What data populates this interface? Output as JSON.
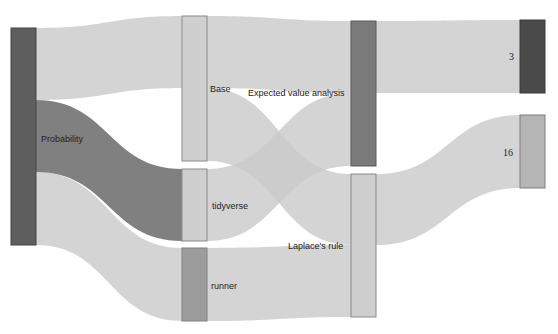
{
  "chart_data": {
    "type": "sankey",
    "nodes": [
      {
        "id": "probability",
        "label": "Probability",
        "column": 0,
        "x": 11,
        "y0": 28,
        "y1": 245,
        "color": "#5e5e5e",
        "stroke": "#444444"
      },
      {
        "id": "base",
        "label": "Base",
        "column": 1,
        "x": 182,
        "y0": 16,
        "y1": 161,
        "color": "#cfcfcf",
        "stroke": "#8a8a8a"
      },
      {
        "id": "tidyverse",
        "label": "tidyverse",
        "column": 1,
        "x": 182,
        "y0": 169,
        "y1": 241,
        "color": "#cfcfcf",
        "stroke": "#8a8a8a"
      },
      {
        "id": "runner",
        "label": "runner",
        "column": 1,
        "x": 182,
        "y0": 248,
        "y1": 321,
        "color": "#9c9c9c",
        "stroke": "#808080"
      },
      {
        "id": "eva",
        "label": "Expected value analysis",
        "column": 2,
        "x": 351,
        "y0": 21,
        "y1": 166,
        "color": "#7a7a7a",
        "stroke": "#5a5a5a"
      },
      {
        "id": "laplace",
        "label": "Laplace's rule",
        "column": 2,
        "x": 351,
        "y0": 174,
        "y1": 317,
        "color": "#cfcfcf",
        "stroke": "#8a8a8a"
      },
      {
        "id": "n3",
        "label": "3",
        "column": 3,
        "x": 520,
        "y0": 20,
        "y1": 93,
        "color": "#4a4a4a",
        "stroke": "#3a3a3a"
      },
      {
        "id": "n16",
        "label": "16",
        "column": 3,
        "x": 520,
        "y0": 115,
        "y1": 188,
        "color": "#b5b5b5",
        "stroke": "#808080"
      }
    ],
    "links": [
      {
        "source": "probability",
        "target": "base",
        "value": 1,
        "sy0": 28,
        "sy1": 100,
        "ty0": 16,
        "ty1": 88,
        "style": "light"
      },
      {
        "source": "probability",
        "target": "tidyverse",
        "value": 1,
        "sy0": 100,
        "sy1": 172,
        "ty0": 169,
        "ty1": 241,
        "style": "dark"
      },
      {
        "source": "probability",
        "target": "runner",
        "value": 1,
        "sy0": 172,
        "sy1": 245,
        "ty0": 248,
        "ty1": 321,
        "style": "light"
      },
      {
        "source": "base",
        "target": "eva",
        "value": 1,
        "sy0": 16,
        "sy1": 88,
        "ty0": 21,
        "ty1": 93,
        "style": "light"
      },
      {
        "source": "base",
        "target": "laplace",
        "value": 1,
        "sy0": 88,
        "sy1": 161,
        "ty0": 174,
        "ty1": 245,
        "style": "light"
      },
      {
        "source": "tidyverse",
        "target": "eva",
        "value": 1,
        "sy0": 169,
        "sy1": 241,
        "ty0": 93,
        "ty1": 166,
        "style": "light"
      },
      {
        "source": "runner",
        "target": "laplace",
        "value": 1,
        "sy0": 248,
        "sy1": 321,
        "ty0": 245,
        "ty1": 317,
        "style": "light"
      },
      {
        "source": "eva",
        "target": "n3",
        "value": 1,
        "sy0": 21,
        "sy1": 93,
        "ty0": 20,
        "ty1": 93,
        "style": "light"
      },
      {
        "source": "laplace",
        "target": "n16",
        "value": 1,
        "sy0": 174,
        "sy1": 245,
        "ty0": 115,
        "ty1": 188,
        "style": "light"
      }
    ],
    "node_width": 25,
    "title": ""
  },
  "labels": {
    "probability": "Probability",
    "base": "Base",
    "tidyverse": "tidyverse",
    "runner": "runner",
    "eva": "Expected value analysis",
    "laplace": "Laplace's rule",
    "n3": "3",
    "n16": "16"
  }
}
